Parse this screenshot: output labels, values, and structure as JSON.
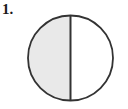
{
  "figure": {
    "item_label": "1.",
    "canvas": {
      "width": 128,
      "height": 109,
      "background_color": "#ffffff"
    },
    "shape": {
      "type": "circle",
      "name": "circle-divided-in-halves",
      "center_x": 70.5,
      "center_y": 58,
      "radius": 42.5,
      "outline_color": "#333333",
      "outline_width": 1.8,
      "divider": {
        "type": "vertical-diameter",
        "x": 70.5,
        "y_top": 15.5,
        "y_bottom": 100.5,
        "color": "#333333",
        "width": 2
      },
      "parts": [
        {
          "name": "left-half",
          "position": "left",
          "shaded": true,
          "fill_color": "#e9e9e9",
          "fraction": "1/2"
        },
        {
          "name": "right-half",
          "position": "right",
          "shaded": false,
          "fill_color": "#ffffff",
          "fraction": "1/2"
        }
      ]
    }
  }
}
